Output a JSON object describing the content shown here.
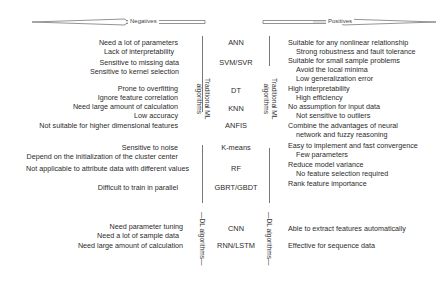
{
  "header": {
    "negatives_label": "Negatives",
    "positives_label": "Positives"
  },
  "groups": {
    "traditional_label_line1": "Traditional ML",
    "traditional_label_line2": "algorithms",
    "dl_label": "DL algorithms"
  },
  "rows": [
    {
      "algorithm": "ANN",
      "negatives": [
        "Need a lot of parameters",
        "Lack of interpretability"
      ],
      "positives": [
        "Suitable for any nonlinear relationship",
        "Strong robustness and fault tolerance"
      ]
    },
    {
      "algorithm": "SVM/SVR",
      "negatives": [
        "Sensitive to missing data",
        "Sensitive to kernel selection"
      ],
      "positives": [
        "Suitable for small sample problems",
        "Avoid the local minima",
        "Low generalization error"
      ]
    },
    {
      "algorithm": "DT",
      "negatives": [
        "Prone to overfitting",
        "Ignore feature correlation"
      ],
      "positives": [
        "High interpretability",
        "High efficiency"
      ]
    },
    {
      "algorithm": "KNN",
      "negatives": [
        "Need large amount of calculation",
        "Low accuracy"
      ],
      "positives": [
        "No assumption for input data",
        "Not sensitive to outliers"
      ]
    },
    {
      "algorithm": "ANFIS",
      "negatives": [
        "Not suitable for higher dimensional features"
      ],
      "positives": [
        "Combine the advantages of neural",
        "network and fuzzy reasoning"
      ]
    },
    {
      "algorithm": "K-means",
      "negatives": [
        "Sensitive to noise",
        "Depend on the initialization of the cluster center"
      ],
      "positives": [
        "Easy to implement and fast convergence",
        "Few parameters"
      ]
    },
    {
      "algorithm": "RF",
      "negatives": [
        "Not applicable to attribute data with different values"
      ],
      "positives": [
        "Reduce model variance",
        "No feature selection required"
      ]
    },
    {
      "algorithm": "GBRT/GBDT",
      "negatives": [
        "Difficult to train in parallel"
      ],
      "positives": [
        "Rank feature importance"
      ]
    },
    {
      "algorithm": "CNN",
      "negatives": [
        "Need parameter tuning",
        "Need a lot of sample data"
      ],
      "positives": [
        "Able to extract features automatically"
      ]
    },
    {
      "algorithm": "RNN/LSTM",
      "negatives": [
        "Need large amount of calculation"
      ],
      "positives": [
        "Effective for sequence data"
      ]
    }
  ]
}
